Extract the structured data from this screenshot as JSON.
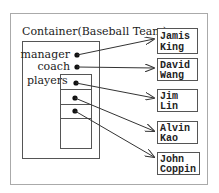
{
  "container": {
    "title": "Container(Baseball Team)",
    "fields": {
      "manager": "manager",
      "coach": "coach",
      "players": "players"
    }
  },
  "people": [
    {
      "line1": "Jamis",
      "line2": "King"
    },
    {
      "line1": "David",
      "line2": "Wang"
    },
    {
      "line1": "Jim",
      "line2": "Lin"
    },
    {
      "line1": "Alvin",
      "line2": "Kao"
    },
    {
      "line1": "John",
      "line2": "Coppin"
    }
  ]
}
